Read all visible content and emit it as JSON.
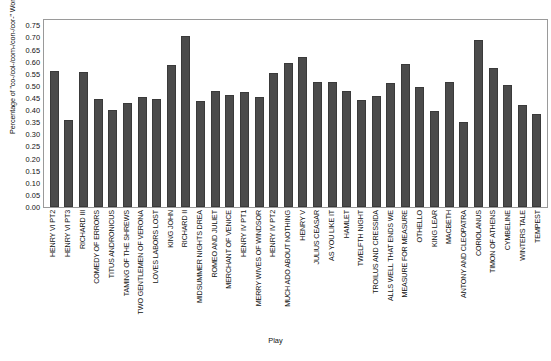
{
  "chart_data": {
    "type": "bar",
    "title": "",
    "xlabel": "Play",
    "ylabel": "Percentage of \"co-/col-/com-/con-/cor-\" Words",
    "ylim": [
      0.0,
      0.78
    ],
    "yticks": [
      "0.00",
      "0.05",
      "0.10",
      "0.15",
      "0.20",
      "0.25",
      "0.30",
      "0.35",
      "0.40",
      "0.45",
      "0.50",
      "0.55",
      "0.60",
      "0.65",
      "0.70",
      "0.75"
    ],
    "ytick_values": [
      0.0,
      0.05,
      0.1,
      0.15,
      0.2,
      0.25,
      0.3,
      0.35,
      0.4,
      0.45,
      0.5,
      0.55,
      0.6,
      0.65,
      0.7,
      0.75
    ],
    "grid": false,
    "legend": null,
    "bar_color": "#4b4b4b",
    "categories": [
      "HENRY VI PT2",
      "HENRY VI PT3",
      "RICHARD III",
      "COMEDY OF ERRORS",
      "TITUS ANDRONICUS",
      "TAMING OF THE SHREWS",
      "TWO GENTLEMEN OF VERONA",
      "LOVES LABORS LOST",
      "KING JOHN",
      "RICHARD II",
      "MIDSUMMER NIGHTS DREA",
      "ROMEO AND JULIET",
      "MERCHANT OF VENICE",
      "HENRY IV PT1",
      "MERRY WIVES OF WINDSOR",
      "HENRY IV PT2",
      "MUCH ADO ABOUT NOTHING",
      "HENRY V",
      "JULIUS CEASAR",
      "AS YOU LIKE IT",
      "HAMLET",
      "TWELFTH NIGHT",
      "TROILUS AND CRESSIDA",
      "ALLS WELL THAT ENDS WE",
      "MEASURE FOR MEASURE",
      "OTHELLO",
      "KING LEAR",
      "MACBETH",
      "ANTONY AND CLEOPATRA",
      "CORIOLANUS",
      "TIMON OF ATHENS",
      "CYMBELINE",
      "WINTERS TALE",
      "TEMPEST"
    ],
    "values": [
      0.563,
      0.36,
      0.558,
      0.445,
      0.402,
      0.43,
      0.455,
      0.445,
      0.585,
      0.705,
      0.437,
      0.48,
      0.462,
      0.475,
      0.455,
      0.555,
      0.595,
      0.62,
      0.517,
      0.515,
      0.478,
      0.443,
      0.458,
      0.512,
      0.592,
      0.494,
      0.396,
      0.518,
      0.352,
      0.69,
      0.573,
      0.505,
      0.42,
      0.382
    ]
  }
}
